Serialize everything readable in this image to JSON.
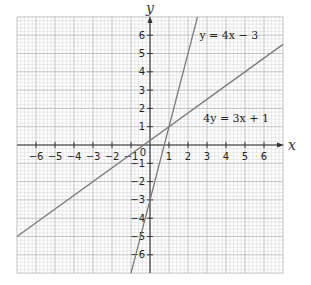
{
  "chart_data": {
    "type": "line",
    "title": "",
    "xlabel": "x",
    "ylabel": "y",
    "xlim": [
      -7,
      7
    ],
    "ylim": [
      -7,
      7
    ],
    "grid": true,
    "grid_minor_divisions": 5,
    "x_ticks": [
      -6,
      -5,
      -4,
      -3,
      -2,
      -1,
      0,
      1,
      2,
      3,
      4,
      5,
      6
    ],
    "y_ticks": [
      -6,
      -5,
      -4,
      -3,
      -2,
      -1,
      1,
      2,
      3,
      4,
      5,
      6
    ],
    "x_tick_labels": [
      "−6",
      "−5",
      "−4",
      "−3",
      "−2",
      "−1",
      "0",
      "1",
      "2",
      "3",
      "4",
      "5",
      "6"
    ],
    "y_tick_labels": [
      "−6",
      "−5",
      "−4",
      "−3",
      "−2",
      "−1",
      "1",
      "2",
      "3",
      "4",
      "5",
      "6"
    ],
    "origin_label": "0",
    "series": [
      {
        "name": "y = 4x − 3",
        "equation": "y = 4x - 3",
        "slope": 4,
        "intercept": -3,
        "x": [
          -1,
          2.5
        ],
        "y": [
          -7,
          7
        ],
        "label_position": [
          2.6,
          6
        ],
        "color": "#808080"
      },
      {
        "name": "4y = 3x + 1",
        "equation": "4y = 3x + 1",
        "slope": 0.75,
        "intercept": 0.25,
        "x": [
          -7,
          7
        ],
        "y": [
          -5,
          5.5
        ],
        "label_position": [
          2.8,
          1.5
        ],
        "color": "#808080"
      }
    ],
    "intersection": [
      1,
      1
    ],
    "legend": "none"
  },
  "colors": {
    "minor_grid": "#dcdcdc",
    "major_grid": "#b4b4b4",
    "axis": "#333333",
    "line": "#7a7a7a"
  }
}
